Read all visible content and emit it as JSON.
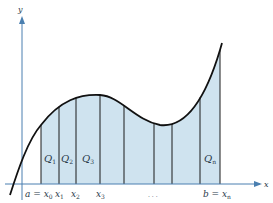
{
  "diagram": {
    "colors": {
      "axis": "#4a7fb0",
      "curve": "#111111",
      "fill": "#cfe3ef",
      "strip_line": "#1a1a1a",
      "text": "#2a3a4a"
    },
    "axis_labels": {
      "x": "x",
      "y": "y"
    },
    "region_labels": [
      {
        "main": "Q",
        "sub": "1"
      },
      {
        "main": "Q",
        "sub": "2"
      },
      {
        "main": "Q",
        "sub": "3"
      },
      {
        "main": "Q",
        "sub": "n"
      }
    ],
    "tick_labels": [
      {
        "pre": "a = ",
        "main": "x",
        "sub": "0"
      },
      {
        "pre": "",
        "main": "x",
        "sub": "1"
      },
      {
        "pre": "",
        "main": "x",
        "sub": "2"
      },
      {
        "pre": "",
        "main": "x",
        "sub": "3"
      },
      {
        "pre": "b = ",
        "main": "x",
        "sub": "n"
      }
    ],
    "ellipsis": ". . .",
    "strip_count": 8
  }
}
